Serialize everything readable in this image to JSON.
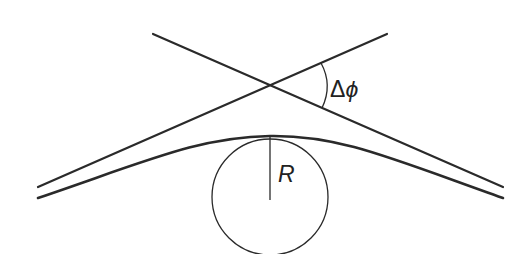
{
  "diagram": {
    "colors": {
      "stroke": "#2a2a2a",
      "background": "#ffffff"
    },
    "labels": {
      "angle_delta": "Δ",
      "angle_phi": "ϕ",
      "radius": "R"
    },
    "geometry": {
      "asymptote_1": {
        "x1": 153,
        "y1": 34,
        "x2": 503,
        "y2": 187
      },
      "asymptote_2": {
        "x1": 38,
        "y1": 187,
        "x2": 387,
        "y2": 34
      },
      "crossing_point": {
        "x": 270,
        "y": 85
      },
      "circle": {
        "cx": 270,
        "cy": 196,
        "r": 58
      },
      "radius_line": {
        "x1": 270,
        "y1": 137,
        "x2": 270,
        "y2": 200
      }
    }
  }
}
